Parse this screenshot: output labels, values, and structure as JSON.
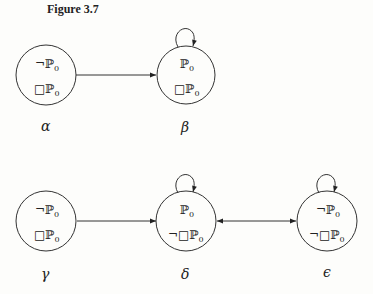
{
  "figure": {
    "title": "Figure 3.7"
  },
  "nodes": [
    {
      "id": "alpha",
      "label": "α",
      "cx": 46,
      "cy": 75,
      "lines": [
        {
          "neg": "¬",
          "box": "",
          "prop": "ℙ",
          "sub": "0"
        },
        {
          "neg": "",
          "box": "□",
          "prop": "ℙ",
          "sub": "0"
        }
      ],
      "self_loop": false
    },
    {
      "id": "beta",
      "label": "β",
      "cx": 186,
      "cy": 75,
      "lines": [
        {
          "neg": "",
          "box": "",
          "prop": "ℙ",
          "sub": "0"
        },
        {
          "neg": "",
          "box": "□",
          "prop": "ℙ",
          "sub": "0"
        }
      ],
      "self_loop": true
    },
    {
      "id": "gamma",
      "label": "γ",
      "cx": 46,
      "cy": 221,
      "lines": [
        {
          "neg": "¬",
          "box": "",
          "prop": "ℙ",
          "sub": "0"
        },
        {
          "neg": "",
          "box": "□",
          "prop": "ℙ",
          "sub": "0"
        }
      ],
      "self_loop": false
    },
    {
      "id": "delta",
      "label": "δ",
      "cx": 186,
      "cy": 221,
      "lines": [
        {
          "neg": "",
          "box": "",
          "prop": "ℙ",
          "sub": "0"
        },
        {
          "neg": "¬",
          "box": "□",
          "prop": "ℙ",
          "sub": "0"
        }
      ],
      "self_loop": true
    },
    {
      "id": "epsilon",
      "label": "ϵ",
      "cx": 327,
      "cy": 221,
      "lines": [
        {
          "neg": "¬",
          "box": "",
          "prop": "ℙ",
          "sub": "0"
        },
        {
          "neg": "¬",
          "box": "□",
          "prop": "ℙ",
          "sub": "0"
        }
      ],
      "self_loop": true
    }
  ],
  "edges": [
    {
      "from": "alpha",
      "to": "beta",
      "directed": "forward"
    },
    {
      "from": "gamma",
      "to": "delta",
      "directed": "forward"
    },
    {
      "from": "delta",
      "to": "epsilon",
      "directed": "both"
    }
  ],
  "node_text": {
    "alpha_l1": "¬ℙ",
    "alpha_l2": "□ℙ",
    "beta_l1": "ℙ",
    "beta_l2": "□ℙ",
    "gamma_l1": "¬ℙ",
    "gamma_l2": "□ℙ",
    "delta_l1": "ℙ",
    "delta_l2": "¬□ℙ",
    "epsilon_l1": "¬ℙ",
    "epsilon_l2": "¬□ℙ",
    "sub": "0"
  },
  "labels": {
    "alpha": "α",
    "beta": "β",
    "gamma": "γ",
    "delta": "δ",
    "epsilon": "ϵ"
  }
}
